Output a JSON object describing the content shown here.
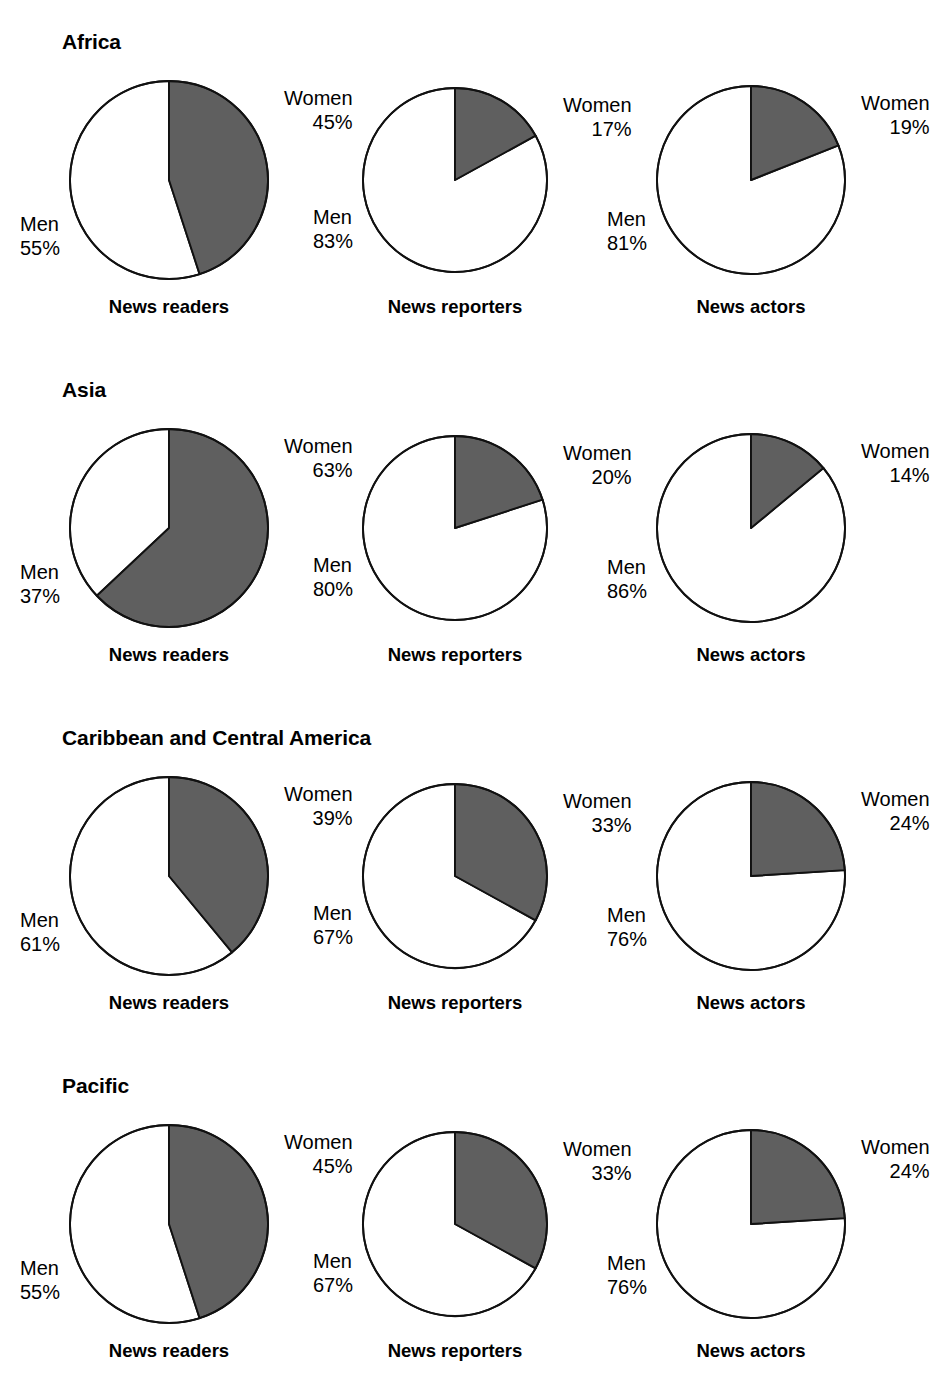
{
  "figure": {
    "series_gray_label": "Women",
    "series_white_label": "Men",
    "gray_color": "#5f5f5f",
    "outline_color": "#111111",
    "background": "#ffffff",
    "percent_suffix": "%"
  },
  "captions": {
    "news_readers": "News readers",
    "news_reporters": "News reporters",
    "news_actors": "News actors"
  },
  "regions": [
    {
      "title": "Africa",
      "charts": [
        {
          "caption": "News readers",
          "women_label": "Women",
          "women_value": "45%",
          "men_label": "Men",
          "men_value": "55%"
        },
        {
          "caption": "News reporters",
          "women_label": "Women",
          "women_value": "17%",
          "men_label": "Men",
          "men_value": "83%"
        },
        {
          "caption": "News actors",
          "women_label": "Women",
          "women_value": "19%",
          "men_label": "Men",
          "men_value": "81%"
        }
      ]
    },
    {
      "title": "Asia",
      "charts": [
        {
          "caption": "News readers",
          "women_label": "Women",
          "women_value": "63%",
          "men_label": "Men",
          "men_value": "37%"
        },
        {
          "caption": "News reporters",
          "women_label": "Women",
          "women_value": "20%",
          "men_label": "Men",
          "men_value": "80%"
        },
        {
          "caption": "News actors",
          "women_label": "Women",
          "women_value": "14%",
          "men_label": "Men",
          "men_value": "86%"
        }
      ]
    },
    {
      "title": "Caribbean and Central America",
      "charts": [
        {
          "caption": "News readers",
          "women_label": "Women",
          "women_value": "39%",
          "men_label": "Men",
          "men_value": "61%"
        },
        {
          "caption": "News reporters",
          "women_label": "Women",
          "women_value": "33%",
          "men_label": "Men",
          "men_value": "67%"
        },
        {
          "caption": "News actors",
          "women_label": "Women",
          "women_value": "24%",
          "men_label": "Men",
          "men_value": "76%"
        }
      ]
    },
    {
      "title": "Pacific",
      "charts": [
        {
          "caption": "News readers",
          "women_label": "Women",
          "women_value": "45%",
          "men_label": "Men",
          "men_value": "55%"
        },
        {
          "caption": "News reporters",
          "women_label": "Women",
          "women_value": "33%",
          "men_label": "Men",
          "men_value": "67%"
        },
        {
          "caption": "News actors",
          "women_label": "Women",
          "women_value": "24%",
          "men_label": "Men",
          "men_value": "76%"
        }
      ]
    }
  ],
  "chart_data": [
    {
      "type": "pie",
      "title": "Africa — News readers",
      "labels": [
        "Women",
        "Men"
      ],
      "values": [
        45,
        55
      ],
      "colors": [
        "#5f5f5f",
        "#ffffff"
      ],
      "units": "percent",
      "start_angle_deg": 0,
      "direction": "clockwise"
    },
    {
      "type": "pie",
      "title": "Africa — News reporters",
      "labels": [
        "Women",
        "Men"
      ],
      "values": [
        17,
        83
      ],
      "colors": [
        "#5f5f5f",
        "#ffffff"
      ],
      "units": "percent",
      "start_angle_deg": 0,
      "direction": "clockwise"
    },
    {
      "type": "pie",
      "title": "Africa — News actors",
      "labels": [
        "Women",
        "Men"
      ],
      "values": [
        19,
        81
      ],
      "colors": [
        "#5f5f5f",
        "#ffffff"
      ],
      "units": "percent",
      "start_angle_deg": 0,
      "direction": "clockwise"
    },
    {
      "type": "pie",
      "title": "Asia — News readers",
      "labels": [
        "Women",
        "Men"
      ],
      "values": [
        63,
        37
      ],
      "colors": [
        "#5f5f5f",
        "#ffffff"
      ],
      "units": "percent",
      "start_angle_deg": 0,
      "direction": "clockwise"
    },
    {
      "type": "pie",
      "title": "Asia — News reporters",
      "labels": [
        "Women",
        "Men"
      ],
      "values": [
        20,
        80
      ],
      "colors": [
        "#5f5f5f",
        "#ffffff"
      ],
      "units": "percent",
      "start_angle_deg": 0,
      "direction": "clockwise"
    },
    {
      "type": "pie",
      "title": "Asia — News actors",
      "labels": [
        "Women",
        "Men"
      ],
      "values": [
        14,
        86
      ],
      "colors": [
        "#5f5f5f",
        "#ffffff"
      ],
      "units": "percent",
      "start_angle_deg": 0,
      "direction": "clockwise"
    },
    {
      "type": "pie",
      "title": "Caribbean and Central America — News readers",
      "labels": [
        "Women",
        "Men"
      ],
      "values": [
        39,
        61
      ],
      "colors": [
        "#5f5f5f",
        "#ffffff"
      ],
      "units": "percent",
      "start_angle_deg": 0,
      "direction": "clockwise"
    },
    {
      "type": "pie",
      "title": "Caribbean and Central America — News reporters",
      "labels": [
        "Women",
        "Men"
      ],
      "values": [
        33,
        67
      ],
      "colors": [
        "#5f5f5f",
        "#ffffff"
      ],
      "units": "percent",
      "start_angle_deg": 0,
      "direction": "clockwise"
    },
    {
      "type": "pie",
      "title": "Caribbean and Central America — News actors",
      "labels": [
        "Women",
        "Men"
      ],
      "values": [
        24,
        76
      ],
      "colors": [
        "#5f5f5f",
        "#ffffff"
      ],
      "units": "percent",
      "start_angle_deg": 0,
      "direction": "clockwise"
    },
    {
      "type": "pie",
      "title": "Pacific — News readers",
      "labels": [
        "Women",
        "Men"
      ],
      "values": [
        45,
        55
      ],
      "colors": [
        "#5f5f5f",
        "#ffffff"
      ],
      "units": "percent",
      "start_angle_deg": 0,
      "direction": "clockwise"
    },
    {
      "type": "pie",
      "title": "Pacific — News reporters",
      "labels": [
        "Women",
        "Men"
      ],
      "values": [
        33,
        67
      ],
      "colors": [
        "#5f5f5f",
        "#ffffff"
      ],
      "units": "percent",
      "start_angle_deg": 0,
      "direction": "clockwise"
    },
    {
      "type": "pie",
      "title": "Pacific — News actors",
      "labels": [
        "Women",
        "Men"
      ],
      "values": [
        24,
        76
      ],
      "colors": [
        "#5f5f5f",
        "#ffffff"
      ],
      "units": "percent",
      "start_angle_deg": 0,
      "direction": "clockwise"
    }
  ]
}
